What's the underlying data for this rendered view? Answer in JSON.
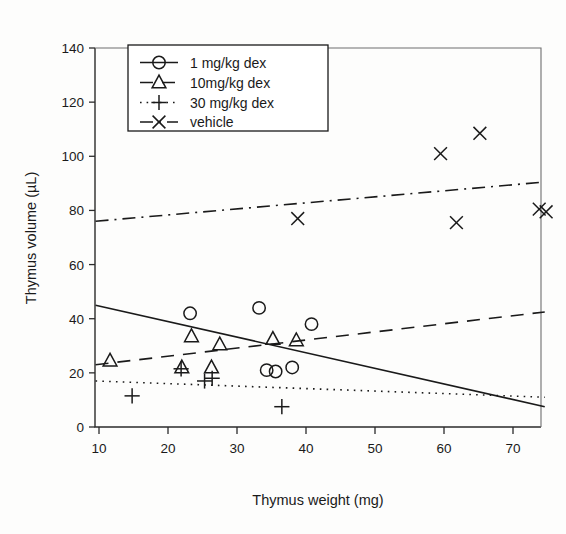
{
  "chart_data": {
    "type": "scatter",
    "title": "",
    "xlabel": "Thymus weight (mg)",
    "ylabel": "Thymus volume (µL)",
    "xlim": [
      8,
      76
    ],
    "ylim": [
      -4,
      145
    ],
    "xticks": [
      10,
      20,
      30,
      40,
      50,
      60,
      70
    ],
    "yticks": [
      0,
      20,
      40,
      60,
      80,
      100,
      120,
      140
    ],
    "grid": false,
    "legend_position": "upper-left-inside",
    "series": [
      {
        "name": "1 mg/kg dex",
        "marker": "circle",
        "linestyle": "solid",
        "points": [
          {
            "x": 23.2,
            "y": 42.0
          },
          {
            "x": 33.2,
            "y": 44.0
          },
          {
            "x": 34.3,
            "y": 21.0
          },
          {
            "x": 35.6,
            "y": 20.5
          },
          {
            "x": 38.0,
            "y": 22.0
          },
          {
            "x": 40.8,
            "y": 38.0
          }
        ],
        "trend": {
          "x1": 9.5,
          "y1": 45.0,
          "x2": 74.6,
          "y2": 7.5
        }
      },
      {
        "name": "10mg/kg dex",
        "marker": "triangle",
        "linestyle": "dashed",
        "points": [
          {
            "x": 11.6,
            "y": 24.5
          },
          {
            "x": 22.0,
            "y": 22.0
          },
          {
            "x": 23.4,
            "y": 33.5
          },
          {
            "x": 26.3,
            "y": 22.0
          },
          {
            "x": 27.5,
            "y": 30.5
          },
          {
            "x": 35.2,
            "y": 32.5
          },
          {
            "x": 38.6,
            "y": 32.0
          }
        ],
        "trend": {
          "x1": 9.5,
          "y1": 23.0,
          "x2": 74.6,
          "y2": 42.5
        }
      },
      {
        "name": "30 mg/kg dex",
        "marker": "plus",
        "linestyle": "dotted",
        "points": [
          {
            "x": 14.8,
            "y": 11.5
          },
          {
            "x": 21.9,
            "y": 21.5
          },
          {
            "x": 25.3,
            "y": 17.0
          },
          {
            "x": 26.4,
            "y": 18.0
          },
          {
            "x": 36.5,
            "y": 7.5
          }
        ],
        "trend": {
          "x1": 9.5,
          "y1": 17.0,
          "x2": 74.6,
          "y2": 11.0
        }
      },
      {
        "name": "vehicle",
        "marker": "cross",
        "linestyle": "dashdot",
        "points": [
          {
            "x": 38.8,
            "y": 77.0
          },
          {
            "x": 59.5,
            "y": 101.0
          },
          {
            "x": 61.8,
            "y": 75.5
          },
          {
            "x": 65.2,
            "y": 108.5
          },
          {
            "x": 73.8,
            "y": 80.5
          },
          {
            "x": 74.8,
            "y": 79.5
          }
        ],
        "trend": {
          "x1": 9.5,
          "y1": 76.0,
          "x2": 74.6,
          "y2": 90.5
        }
      }
    ]
  },
  "legend": {
    "entries": [
      {
        "label": "1 mg/kg dex"
      },
      {
        "label": "10mg/kg dex"
      },
      {
        "label": "30 mg/kg dex"
      },
      {
        "label": "vehicle"
      }
    ]
  }
}
